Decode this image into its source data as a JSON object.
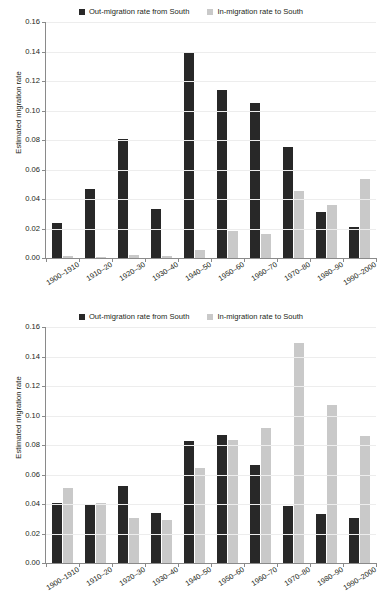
{
  "figure": {
    "legend": [
      {
        "label": "Out-migration rate from South",
        "color": "#282828",
        "key": "out"
      },
      {
        "label": "In-migration rate to South",
        "color": "#c9c9c9",
        "key": "in"
      }
    ],
    "ylabel": "Estimated migration rate",
    "yticks": [
      "0.00",
      "0.02",
      "0.04",
      "0.06",
      "0.08",
      "0.10",
      "0.12",
      "0.14",
      "0.16"
    ]
  },
  "chart_data": [
    {
      "type": "bar",
      "panel": "top",
      "title": "",
      "xlabel": "",
      "ylabel": "Estimated migration rate",
      "ylim": [
        0,
        0.16
      ],
      "ytick_values": [
        0.0,
        0.02,
        0.04,
        0.06,
        0.08,
        0.1,
        0.12,
        0.14,
        0.16
      ],
      "ytick_labels": [
        "0.00",
        "0.02",
        "0.04",
        "0.06",
        "0.08",
        "0.10",
        "0.12",
        "0.14",
        "0.16"
      ],
      "grid": true,
      "legend_position": "top-center",
      "categories": [
        "1900–1910",
        "1910–20",
        "1920–30",
        "1930–40",
        "1940–50",
        "1950–60",
        "1960–70",
        "1970–80",
        "1980–90",
        "1990–2000"
      ],
      "series": [
        {
          "name": "Out-migration rate from South",
          "color": "#282828",
          "values": [
            0.024,
            0.0465,
            0.081,
            0.0334,
            0.14,
            0.1139,
            0.1052,
            0.075,
            0.031,
            0.0212
          ]
        },
        {
          "name": "In-migration rate to South",
          "color": "#c9c9c9",
          "values": [
            0.0015,
            0.0007,
            0.0018,
            0.0015,
            0.0055,
            0.0186,
            0.016,
            0.0452,
            0.036,
            0.0533
          ]
        }
      ]
    },
    {
      "type": "bar",
      "panel": "bottom",
      "title": "",
      "xlabel": "",
      "ylabel": "Estimated migration rate",
      "ylim": [
        0,
        0.16
      ],
      "ytick_values": [
        0.0,
        0.02,
        0.04,
        0.06,
        0.08,
        0.1,
        0.12,
        0.14,
        0.16
      ],
      "ytick_labels": [
        "0.00",
        "0.02",
        "0.04",
        "0.06",
        "0.08",
        "0.10",
        "0.12",
        "0.14",
        "0.16"
      ],
      "grid": true,
      "legend_position": "top-center",
      "categories": [
        "1900–1910",
        "1910–20",
        "1920–30",
        "1930–40",
        "1940–50",
        "1950–60",
        "1960–70",
        "1970–80",
        "1980–90",
        "1990–2000"
      ],
      "series": [
        {
          "name": "Out-migration rate from South",
          "color": "#282828",
          "values": [
            0.0405,
            0.0395,
            0.0522,
            0.0338,
            0.083,
            0.087,
            0.0665,
            0.0385,
            0.0334,
            0.0303
          ]
        },
        {
          "name": "In-migration rate to South",
          "color": "#c9c9c9",
          "values": [
            0.051,
            0.0408,
            0.0306,
            0.029,
            0.0642,
            0.0832,
            0.0918,
            0.1492,
            0.107,
            0.0858
          ]
        }
      ]
    }
  ]
}
